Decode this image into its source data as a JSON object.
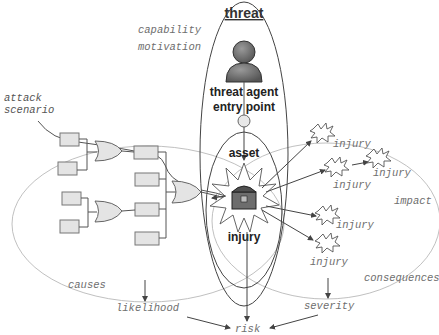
{
  "diagram": {
    "title": "threat",
    "threat_agent_label": "threat agent",
    "entry_point_label": "entry point",
    "asset_label": "asset",
    "injury_center_label": "injury",
    "capability_label": "capability",
    "motivation_label": "motivation",
    "attack_scenario_line1": "attack",
    "attack_scenario_line2": "scenario",
    "causes_label": "causes",
    "likelihood_label": "likelihood",
    "consequences_label": "consequences",
    "impact_label": "impact",
    "severity_label": "severity",
    "risk_label": "risk",
    "injury_labels": [
      "injury",
      "injury",
      "injury",
      "injury",
      "injury"
    ],
    "icons": {
      "threat_agent": "person-icon",
      "asset": "treasure-chest-icon",
      "injury": "explosion-icon"
    },
    "colors": {
      "box_fill": "#e4e4e4",
      "person_fill": "#6a6a6a",
      "label_gray": "#6e6e6e",
      "line": "#444444"
    }
  }
}
